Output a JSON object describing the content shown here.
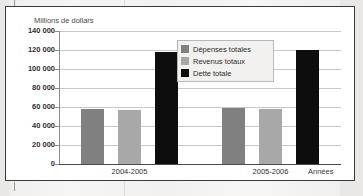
{
  "chart_data": {
    "type": "bar",
    "title": "",
    "ylabel": "Millions de dollars",
    "xlabel": "Années",
    "categories": [
      "2004-2005",
      "2005-2006"
    ],
    "series": [
      {
        "name": "Dépenses totales",
        "color": "#808080",
        "values": [
          57500,
          59000
        ]
      },
      {
        "name": "Revenus totaux",
        "color": "#a8a8a8",
        "values": [
          56500,
          58000
        ]
      },
      {
        "name": "Dette totale",
        "color": "#0d0d0d",
        "values": [
          118000,
          120000
        ]
      }
    ],
    "ylim": [
      0,
      140000
    ],
    "ytick_step": 20000,
    "ytick_labels": [
      "140 000",
      "120 000",
      "100 000",
      "80 000",
      "60 000",
      "40 000",
      "20 000",
      "0"
    ],
    "ytick_values": [
      140000,
      120000,
      100000,
      80000,
      60000,
      40000,
      20000,
      0
    ],
    "grid": true,
    "legend_position": "top-center"
  },
  "legend": {
    "items": [
      {
        "label": "Dépenses totales",
        "color": "#808080"
      },
      {
        "label": "Revenus totaux",
        "color": "#a8a8a8"
      },
      {
        "label": "Dette totale",
        "color": "#0d0d0d"
      }
    ]
  },
  "axes": {
    "y_title": "Millions de dollars",
    "x_title": "Années"
  }
}
